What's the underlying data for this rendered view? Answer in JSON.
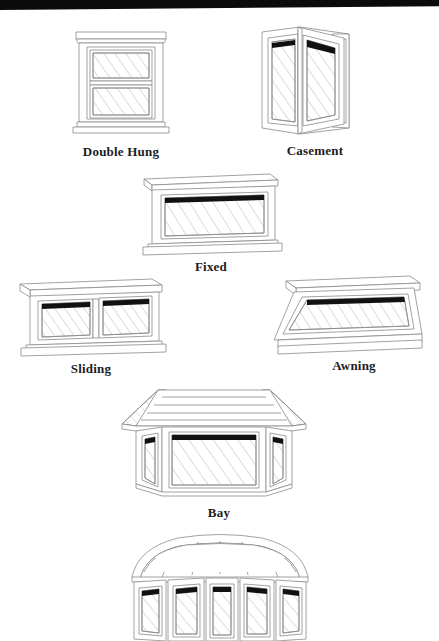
{
  "document": {
    "title": "Window Types",
    "kind": "scanned-line-diagram",
    "background_color": "#ffffff",
    "line_color": "#8a8a8a",
    "dark_band_color": "#111111",
    "caption_color": "#1d1d1d",
    "scan_artifact": {
      "name": "top-black-scan-band",
      "color": "#0b0b0b",
      "height_px": 10
    }
  },
  "figures": [
    {
      "id": "double-hung",
      "label": "Double Hung",
      "description": "Front elevation of a double hung window with two stacked sashes, head casing and sill",
      "sash_count": 2,
      "view": "elevation"
    },
    {
      "id": "casement",
      "label": "Casement",
      "description": "Perspective view of a casement window with the sash swung open on side hinges",
      "sash_count": 1,
      "view": "perspective",
      "state": "open"
    },
    {
      "id": "fixed",
      "label": "Fixed",
      "description": "Perspective view of a wide fixed picture window that does not open",
      "sash_count": 1,
      "view": "perspective",
      "state": "fixed"
    },
    {
      "id": "sliding",
      "label": "Sliding",
      "description": "Perspective view of a horizontal sliding window with two side by side sashes",
      "sash_count": 2,
      "view": "perspective"
    },
    {
      "id": "awning",
      "label": "Awning",
      "description": "Perspective view of an awning window hinged at the top and swung outward at the bottom",
      "sash_count": 1,
      "view": "perspective",
      "state": "open"
    },
    {
      "id": "bay",
      "label": "Bay",
      "description": "Perspective view of a bay window projecting outward with one large center pane and two angled flanking panes under a sloped roof",
      "sash_count": 3,
      "view": "perspective"
    },
    {
      "id": "bow",
      "label": "",
      "description": "Perspective view of a bow window with five panes in a gentle curve under a domed roof, cropped by the bottom edge of the page",
      "sash_count": 5,
      "view": "perspective",
      "cropped": true
    }
  ]
}
